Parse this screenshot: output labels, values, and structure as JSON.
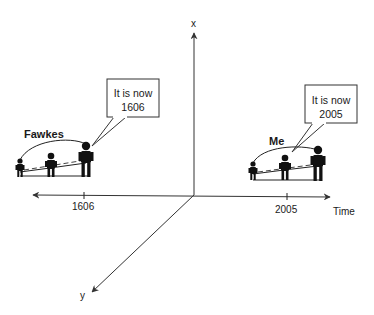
{
  "axes": {
    "x_label": "x",
    "y_label": "y",
    "time_label": "Time"
  },
  "ticks": [
    {
      "label": "1606"
    },
    {
      "label": "2005"
    }
  ],
  "groups": [
    {
      "name": "Fawkes",
      "bubble_line1": "It is now",
      "bubble_line2": "1606"
    },
    {
      "name": "Me",
      "bubble_line1": "It is now",
      "bubble_line2": "2005"
    }
  ]
}
